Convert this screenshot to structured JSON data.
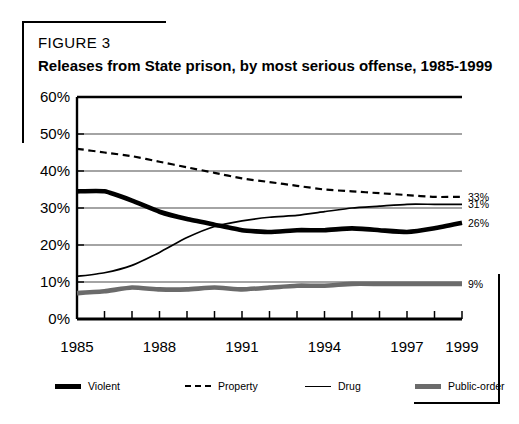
{
  "figure": {
    "label": "FIGURE 3",
    "title": "Releases from State prison, by most serious offense, 1985-1999"
  },
  "chart_data": {
    "type": "line",
    "title": "Releases from State prison, by most serious offense, 1985-1999",
    "xlabel": "",
    "ylabel": "",
    "xlim": [
      1985,
      1999
    ],
    "ylim": [
      0,
      60
    ],
    "grid": true,
    "legend_position": "bottom",
    "y_tick_labels": [
      "60%",
      "50%",
      "40%",
      "30%",
      "20%",
      "10%",
      "0%"
    ],
    "y_tick_values": [
      60,
      50,
      40,
      30,
      20,
      10,
      0
    ],
    "x_tick_labels": [
      "1985",
      "1988",
      "1991",
      "1994",
      "1997",
      "1999"
    ],
    "x_tick_values": [
      1985,
      1988,
      1991,
      1994,
      1997,
      1999
    ],
    "x": [
      1985,
      1986,
      1987,
      1988,
      1989,
      1990,
      1991,
      1992,
      1993,
      1994,
      1995,
      1996,
      1997,
      1998,
      1999
    ],
    "series": [
      {
        "name": "Violent",
        "style": "thick-black",
        "color": "#000000",
        "end_label": "26%",
        "values": [
          34.5,
          34.5,
          32.0,
          29.0,
          27.0,
          25.5,
          24.0,
          23.5,
          24.0,
          24.0,
          24.5,
          24.0,
          23.5,
          24.5,
          26.0
        ]
      },
      {
        "name": "Property",
        "style": "dashed",
        "color": "#000000",
        "end_label": "33%",
        "values": [
          46.0,
          45.0,
          44.0,
          42.5,
          41.0,
          39.5,
          38.0,
          37.0,
          36.0,
          35.0,
          34.5,
          34.0,
          33.5,
          33.0,
          33.0
        ]
      },
      {
        "name": "Drug",
        "style": "thin",
        "color": "#000000",
        "end_label": "31%",
        "values": [
          11.5,
          12.5,
          14.5,
          18.0,
          22.0,
          25.0,
          26.5,
          27.5,
          28.0,
          29.0,
          30.0,
          30.5,
          31.0,
          31.0,
          31.0
        ]
      },
      {
        "name": "Public-order",
        "style": "thick-gray",
        "color": "#6b6b6b",
        "end_label": "9%",
        "values": [
          7.0,
          7.5,
          8.5,
          8.0,
          8.0,
          8.5,
          8.0,
          8.5,
          9.0,
          9.0,
          9.5,
          9.5,
          9.5,
          9.5,
          9.5
        ]
      }
    ]
  },
  "legend": {
    "items": [
      {
        "label": "Violent",
        "swatch": "violent-line-swatch"
      },
      {
        "label": "Property",
        "swatch": "property-dashed-swatch"
      },
      {
        "label": "Drug",
        "swatch": "drug-line-swatch"
      },
      {
        "label": "Public-order",
        "swatch": "public-order-line-swatch"
      }
    ]
  }
}
